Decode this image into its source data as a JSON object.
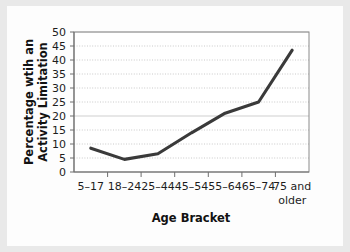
{
  "chart_data": {
    "type": "line",
    "title": "",
    "xlabel": "Age Bracket",
    "ylabel_line1": "Percentage wtih an",
    "ylabel_line2": "Activity Limitation",
    "categories": [
      "5–17",
      "18–24",
      "25–44",
      "45–54",
      "55–64",
      "65–74",
      "75 and older"
    ],
    "category_lines": [
      [
        "5–17"
      ],
      [
        "18–24"
      ],
      [
        "25–44"
      ],
      [
        "45–54"
      ],
      [
        "55–64"
      ],
      [
        "65–74"
      ],
      [
        "75 and",
        "older"
      ]
    ],
    "values": [
      8.5,
      4.5,
      6.5,
      14,
      21,
      25,
      43.5
    ],
    "yticks": [
      0,
      5,
      10,
      15,
      20,
      25,
      30,
      35,
      40,
      45,
      50
    ],
    "ylim": [
      0,
      50
    ],
    "grid": true,
    "legend": false,
    "line_color": "#3a3a3a",
    "grid_color": "#bdbdbd",
    "frame_color": "#8b8b8b",
    "background_color": "#fdfdfd",
    "page_color": "#e9e9e9"
  }
}
